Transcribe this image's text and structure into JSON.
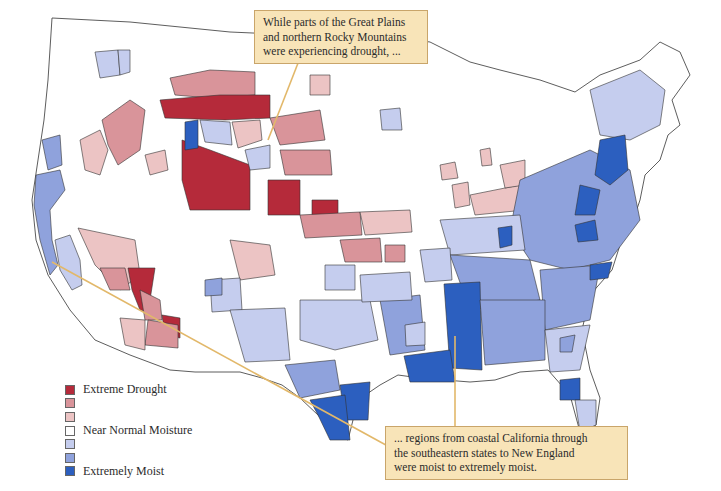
{
  "map": {
    "type": "choropleth",
    "subject": "Climate-division moisture conditions, contiguous United States",
    "colors": {
      "extreme_drought": "#b52a3a",
      "moderate_drought": "#d9949a",
      "mild_drought": "#ecc4c4",
      "near_normal": "#ffffff",
      "mild_moist": "#c5cdee",
      "moderate_moist": "#8fa2dc",
      "extremely_moist": "#2c5fbf",
      "boundary": "#333333",
      "callout_fill": "#f8e4b8",
      "leader_line": "#e2b86a"
    }
  },
  "legend": {
    "items": [
      {
        "label": "Extreme Drought",
        "color": "#b52a3a"
      },
      {
        "label": "",
        "color": "#d9949a"
      },
      {
        "label": "",
        "color": "#ecc4c4"
      },
      {
        "label": "Near Normal Moisture",
        "color": "#ffffff"
      },
      {
        "label": "",
        "color": "#c5cdee"
      },
      {
        "label": "",
        "color": "#8fa2dc"
      },
      {
        "label": "Extremely Moist",
        "color": "#2c5fbf"
      }
    ]
  },
  "callouts": {
    "top": {
      "lines": [
        "While parts of the Great Plains",
        "and northern Rocky Mountains",
        "were experiencing drought, ..."
      ]
    },
    "bottom": {
      "lines": [
        "... regions from coastal California through",
        "the southeastern states to New England",
        "were moist to extremely moist."
      ]
    }
  }
}
